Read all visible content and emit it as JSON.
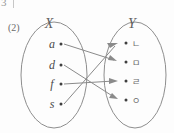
{
  "page_fragment": {
    "number": "3",
    "separator_visible": true
  },
  "item": {
    "number": "(2)"
  },
  "diagram": {
    "type": "mapping-diagram",
    "domain_set": {
      "label": "X",
      "elements": [
        {
          "label": "a",
          "x": 60,
          "y": 44
        },
        {
          "label": "d",
          "x": 60,
          "y": 65
        },
        {
          "label": "f",
          "x": 60,
          "y": 84
        },
        {
          "label": "s",
          "x": 60,
          "y": 104
        }
      ],
      "ellipse": {
        "cx": 54,
        "cy": 75,
        "rx": 33,
        "ry": 53
      }
    },
    "codomain_set": {
      "label": "Y",
      "elements": [
        {
          "label": "ㄴ",
          "x": 127,
          "y": 44
        },
        {
          "label": "ㅁ",
          "x": 127,
          "y": 62
        },
        {
          "label": "ㄹ",
          "x": 127,
          "y": 81
        },
        {
          "label": "ㅇ",
          "x": 127,
          "y": 100
        }
      ],
      "ellipse": {
        "cx": 135,
        "cy": 75,
        "rx": 31,
        "ry": 53
      }
    },
    "mappings": [
      {
        "from": "a",
        "to": "ㅁ"
      },
      {
        "from": "d",
        "to": "ㅇ"
      },
      {
        "from": "f",
        "to": "ㄹ"
      },
      {
        "from": "s",
        "to": "ㄴ"
      }
    ]
  },
  "colors": {
    "stroke": "#8e8e8e",
    "arrow": "#8a8a8a",
    "text": "#4a4a4a",
    "label": "#5d5d5d",
    "background": "#fdfdfd"
  }
}
